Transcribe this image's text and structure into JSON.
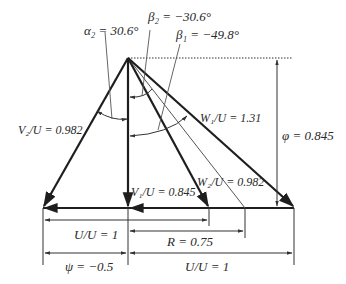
{
  "diagram": {
    "labels": {
      "alpha2": "α₂ = 30.6°",
      "beta2": "β₂ = −30.6°",
      "beta1": "β₁ = −49.8°",
      "v2": "V₂/U = 0.982",
      "w1": "W₁/U = 1.31",
      "phi": "φ = 0.845",
      "v1": "V₁/U = 0.845",
      "w2": "W₂/U = 0.982",
      "uu_top": "U/U = 1",
      "r": "R = 0.75",
      "psi": "ψ = −0.5",
      "uu_bottom": "U/U = 1"
    },
    "values": {
      "alpha2_deg": 30.6,
      "beta2_deg": -30.6,
      "beta1_deg": -49.8,
      "V2_over_U": 0.982,
      "W1_over_U": 1.31,
      "phi": 0.845,
      "V1_over_U": 0.845,
      "W2_over_U": 0.982,
      "R": 0.75,
      "psi": -0.5,
      "U_over_U": 1
    },
    "colors": {
      "line": "#1e1e1e",
      "thin_line": "#555555",
      "text": "#2a2a2a"
    }
  }
}
